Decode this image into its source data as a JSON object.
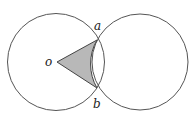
{
  "diagram": {
    "type": "geometry",
    "labels": {
      "o": "o",
      "a": "a",
      "b": "b"
    },
    "colors": {
      "stroke": "#555555",
      "fill_shaded": "#b8b8b8",
      "background": "#ffffff"
    }
  }
}
